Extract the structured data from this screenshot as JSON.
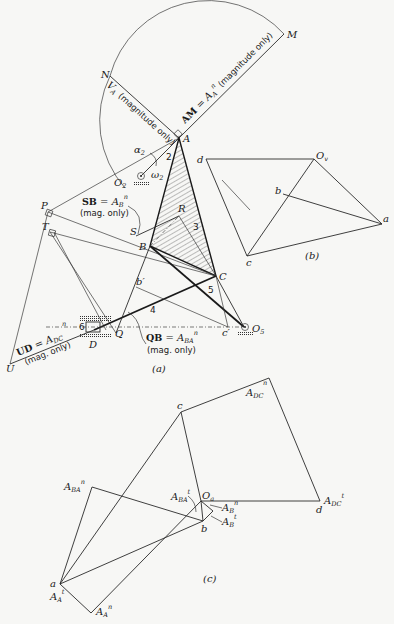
{
  "figure": {
    "subfigures": [
      {
        "id": "a",
        "caption": "(a)",
        "description": "Linkage mechanism configuration with acceleration construction"
      },
      {
        "id": "b",
        "caption": "(b)",
        "description": "Velocity polygon"
      },
      {
        "id": "c",
        "caption": "(c)",
        "description": "Acceleration polygon"
      }
    ]
  },
  "part_a": {
    "caption": "(a)",
    "points": {
      "M": "M",
      "N": "N",
      "A": "A",
      "O2": "O",
      "O2_sub": "2",
      "P": "P",
      "T": "T",
      "S": "S",
      "R": "R",
      "B": "B",
      "C": "C",
      "b_prime": "b′",
      "c_prime": "c′",
      "D": "D",
      "Q": "Q",
      "U": "U",
      "O5": "O",
      "O5_sub": "5"
    },
    "link_numbers": [
      "2",
      "3",
      "4",
      "5",
      "6"
    ],
    "angular": {
      "alpha": "α",
      "alpha_sub": "2",
      "omega": "ω",
      "omega_sub": "2"
    },
    "annotations": {
      "VA": "V",
      "VA_sub": "A",
      "VA_note": "(magnitude only)",
      "AM_bold": "AM",
      "AM_eq": " = A",
      "AM_sub": "A",
      "AM_sup": "n",
      "AM_note": " (magnitude only)",
      "SB_bold": "SB",
      "SB_eq": " = A",
      "SB_sub": "B",
      "SB_sup": "n",
      "SB_note": "(mag. only)",
      "QB_bold": "QB",
      "QB_eq": " = A",
      "QB_sub": "BA",
      "QB_sup": "n",
      "QB_note": "(mag. only)",
      "UD_bold": "UD",
      "UD_eq": " = A",
      "UD_sub": "DC",
      "UD_sup": "n",
      "UD_note": "(mag. only)",
      "n_mark": "n"
    }
  },
  "part_b": {
    "caption": "(b)",
    "points": {
      "Ov": "O",
      "Ov_sub": "v",
      "d": "d",
      "b": "b",
      "a": "a",
      "c": "c"
    }
  },
  "part_c": {
    "caption": "(c)",
    "points": {
      "c": "c",
      "d": "d",
      "Oa": "O",
      "Oa_sub": "a",
      "b": "b",
      "a": "a"
    },
    "vectors": {
      "ADCn": "A",
      "ADCn_sub": "DC",
      "ADCn_sup": "n",
      "ADCt": "A",
      "ADCt_sub": "DC",
      "ADCt_sup": "t",
      "ABAn": "A",
      "ABAn_sub": "BA",
      "ABAn_sup": "n",
      "ABAt": "A",
      "ABAt_sub": "BA",
      "ABAt_sup": "t",
      "ABn": "A",
      "ABn_sub": "B",
      "ABn_sup": "n",
      "ABt": "A",
      "ABt_sub": "B",
      "ABt_sup": "t",
      "AAt": "A",
      "AAt_sub": "A",
      "AAt_sup": "t",
      "AAn": "A",
      "AAn_sub": "A",
      "AAn_sup": "n"
    }
  },
  "colors": {
    "ink": "#1a1a1a",
    "paper": "#f7f7f5"
  }
}
